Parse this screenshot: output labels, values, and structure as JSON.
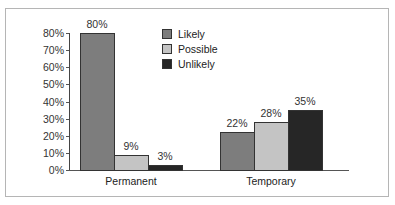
{
  "chart_data": {
    "type": "bar",
    "title": "",
    "xlabel": "",
    "ylabel": "",
    "ylim": [
      0,
      80
    ],
    "yticks": [
      "0%",
      "10%",
      "20%",
      "30%",
      "40%",
      "50%",
      "60%",
      "70%",
      "80%"
    ],
    "categories": [
      "Permanent",
      "Temporary"
    ],
    "series": [
      {
        "name": "Likely",
        "color": "#7d7d7d",
        "values": [
          80,
          22
        ],
        "labels": [
          "80%",
          "22%"
        ]
      },
      {
        "name": "Possible",
        "color": "#c4c4c4",
        "values": [
          9,
          28
        ],
        "labels": [
          "9%",
          "28%"
        ]
      },
      {
        "name": "Unlikely",
        "color": "#262626",
        "values": [
          3,
          35
        ],
        "labels": [
          "3%",
          "35%"
        ]
      }
    ],
    "legend_position": "top-center",
    "grid": false
  }
}
